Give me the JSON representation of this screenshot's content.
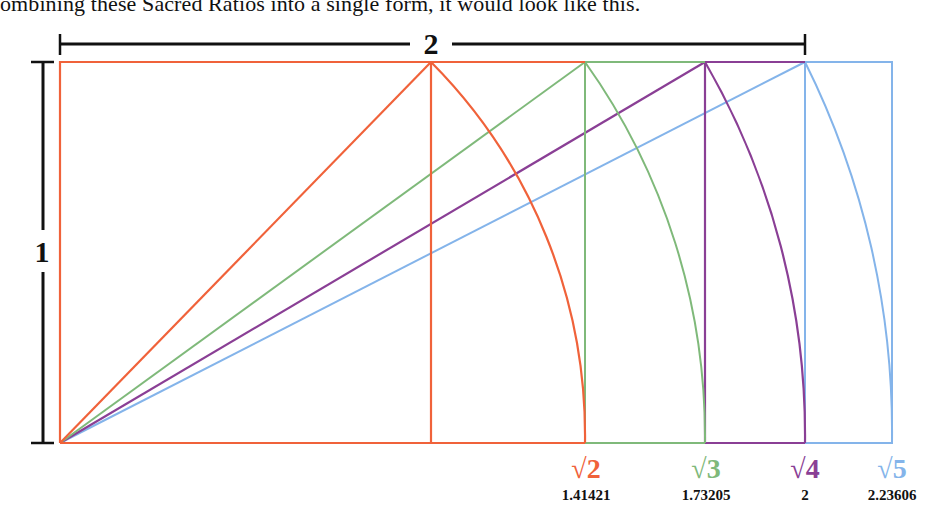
{
  "caption": "ombining these Sacred Ratios into a single form, it would look like this.",
  "dimensions": {
    "width_label": "2",
    "height_label": "1"
  },
  "colors": {
    "root2": "#f0623a",
    "root3": "#7fb97a",
    "root4": "#8a3f95",
    "root5": "#84b4ea",
    "dimension": "#111111"
  },
  "rectangles": [
    {
      "id": "root2",
      "symbol": "√2",
      "value": "1.41421"
    },
    {
      "id": "root3",
      "symbol": "√3",
      "value": "1.73205"
    },
    {
      "id": "root4",
      "symbol": "√4",
      "value": "2"
    },
    {
      "id": "root5",
      "symbol": "√5",
      "value": "2.23606"
    }
  ]
}
